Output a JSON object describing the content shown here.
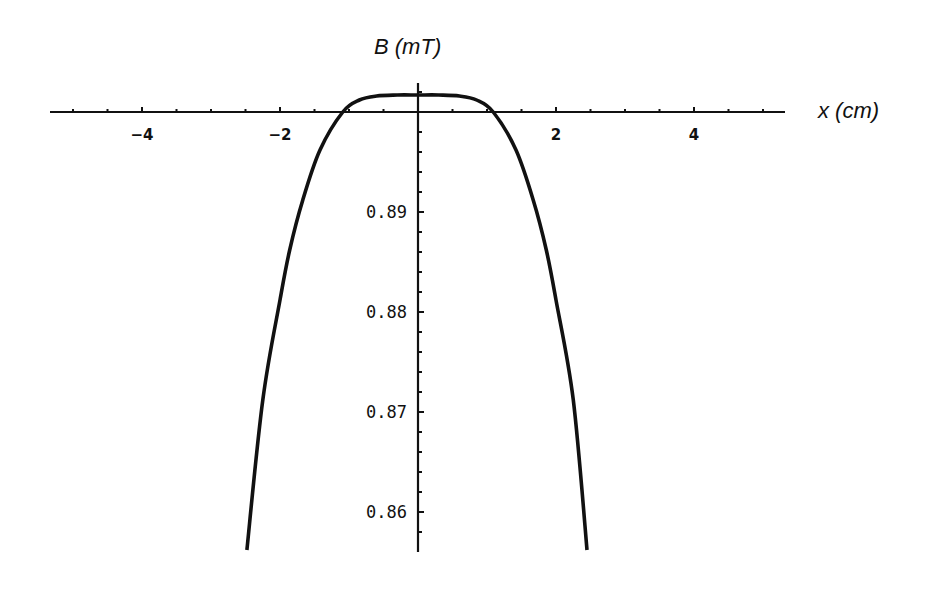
{
  "chart_data": {
    "type": "line",
    "title": "",
    "xlabel": "x (cm)",
    "ylabel": "B (mT)",
    "xlim": [
      -5.33,
      5.32
    ],
    "ylim": [
      0.8555,
      0.902
    ],
    "x_axis_crossing_y": 0.9,
    "x_ticks": [
      -4,
      -2,
      2,
      4
    ],
    "x_tick_labels": [
      "-4",
      "-2",
      "2",
      "4"
    ],
    "x_minor_tick_step": 0.5,
    "y_ticks": [
      0.86,
      0.87,
      0.88,
      0.89
    ],
    "y_tick_labels": [
      "0.86",
      "0.87",
      "0.88",
      "0.89"
    ],
    "y_minor_tick_step": 0.002,
    "grid": false,
    "legend": null,
    "series": [
      {
        "name": "B(x)",
        "color": "#111111",
        "x": [
          -2.48,
          -2.25,
          -2.0,
          -1.86,
          -1.67,
          -1.42,
          -1.09,
          -0.85,
          -0.6,
          -0.3,
          0.0,
          0.3,
          0.6,
          0.85,
          1.09,
          1.42,
          1.67,
          1.86,
          2.0,
          2.25,
          2.45
        ],
        "y": [
          0.8562,
          0.8712,
          0.8812,
          0.8862,
          0.8912,
          0.8962,
          0.9,
          0.9012,
          0.9016,
          0.9017,
          0.9017,
          0.9017,
          0.9016,
          0.9012,
          0.9,
          0.8962,
          0.8912,
          0.8862,
          0.8812,
          0.8712,
          0.8562
        ]
      }
    ]
  }
}
